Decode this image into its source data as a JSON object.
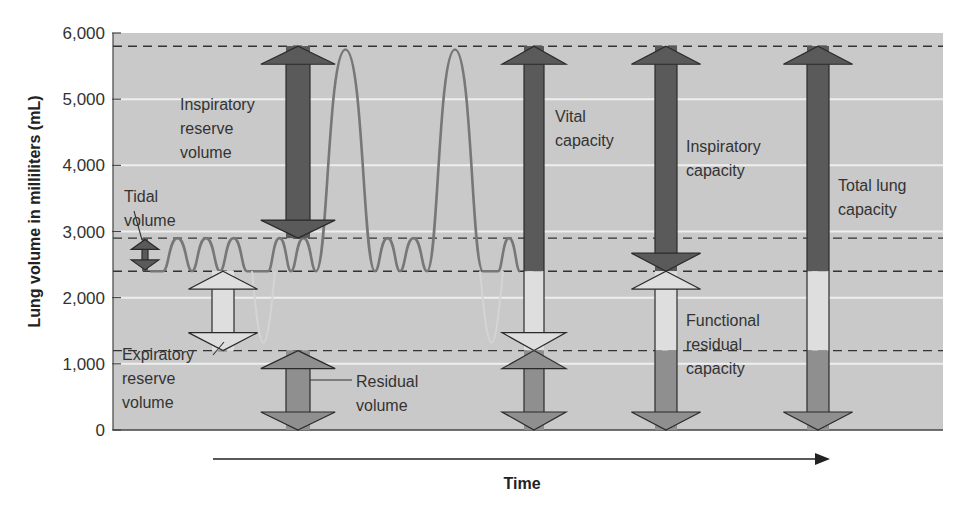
{
  "chart_data": {
    "type": "line",
    "title": "",
    "xlabel": "Time",
    "ylabel": "Lung volume in milliliters (mL)",
    "ylim": [
      0,
      6000
    ],
    "y_ticks": [
      0,
      1000,
      2000,
      3000,
      4000,
      5000,
      6000
    ],
    "y_tick_labels": [
      "0",
      "1,000",
      "2,000",
      "3,000",
      "4,000",
      "5,000",
      "6,000"
    ],
    "grid": true,
    "reference_levels_mL": {
      "max_inspiration": 5800,
      "end_tidal_inspiration": 2900,
      "end_tidal_expiration": 2400,
      "max_expiration": 1200
    },
    "volumes_mL": {
      "tidal_volume": 500,
      "inspiratory_reserve_volume": 2900,
      "expiratory_reserve_volume": 1200,
      "residual_volume": 1200,
      "vital_capacity": 4600,
      "inspiratory_capacity": 3400,
      "functional_residual_capacity": 2400,
      "total_lung_capacity": 5800
    },
    "series": [
      {
        "name": "Spirogram trace",
        "description": "Tidal breathing between 2400 and 2900 mL, with two maximal inspirations to ~5750 mL and faint maximal expirations to ~1300 mL"
      }
    ]
  },
  "labels": {
    "tidal_volume": [
      "Tidal",
      "volume"
    ],
    "inspiratory_reserve_volume": [
      "Inspiratory",
      "reserve",
      "volume"
    ],
    "expiratory_reserve_volume": [
      "Expiratory",
      "reserve",
      "volume"
    ],
    "residual_volume": [
      "Residual",
      "volume"
    ],
    "vital_capacity": [
      "Vital",
      "capacity"
    ],
    "inspiratory_capacity": [
      "Inspiratory",
      "capacity"
    ],
    "functional_residual_capacity": [
      "Functional",
      "residual",
      "capacity"
    ],
    "total_lung_capacity": [
      "Total lung",
      "capacity"
    ]
  },
  "colors": {
    "plot_bg": "#c9c9c9",
    "grid": "#eeeeee",
    "dashed": "#333333",
    "trace": "#777777",
    "dark_arrow": "#5a5a5a",
    "light_arrow": "#dedede",
    "mid_arrow": "#8f8f8f",
    "outline": "#2a2a2a"
  }
}
